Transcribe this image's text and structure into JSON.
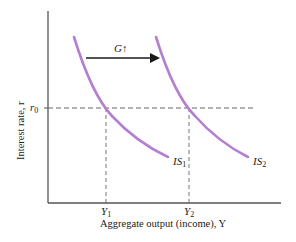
{
  "diagram": {
    "colors": {
      "axis": "#555555",
      "curve": "#b57fcf",
      "dashed": "#666666",
      "arrow": "#1a1a1a",
      "text": "#222222"
    },
    "y_axis_label": "Interest rate, r",
    "x_axis_label": "Aggregate output (income), Y",
    "r0_label": "r",
    "r0_sub": "0",
    "y1_label": "Y",
    "y1_sub": "1",
    "y2_label": "Y",
    "y2_sub": "2",
    "is1_label": "IS",
    "is1_sub": "1",
    "is2_label": "IS",
    "is2_sub": "2",
    "shift_label": "G",
    "shift_symbol": "↑"
  }
}
